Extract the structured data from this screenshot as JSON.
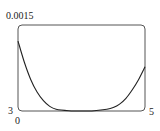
{
  "chart_data": {
    "type": "line",
    "title": "",
    "xlabel": "",
    "ylabel": "",
    "xlim": [
      3,
      5
    ],
    "ylim": [
      0,
      0.0015
    ],
    "grid": false,
    "legend": null,
    "tick_labels": {
      "x_min": "3",
      "x_max": "5",
      "y_min": "0",
      "y_max": "0.0015"
    },
    "series": [
      {
        "name": "curve",
        "x": [
          3.0,
          3.1,
          3.2,
          3.3,
          3.4,
          3.5,
          3.6,
          3.8,
          4.0,
          4.2,
          4.4,
          4.5,
          4.6,
          4.7,
          4.8,
          4.9,
          5.0
        ],
        "y": [
          0.00122,
          0.00085,
          0.00055,
          0.00033,
          0.00018,
          8e-05,
          3e-05,
          5e-06,
          0.0,
          5e-06,
          3e-05,
          6e-05,
          0.00012,
          0.00022,
          0.00037,
          0.00055,
          0.00077
        ]
      }
    ]
  }
}
